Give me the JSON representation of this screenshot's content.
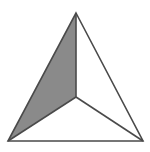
{
  "figure": {
    "name": "shaded-tetrahedron-net",
    "canvas": {
      "width": 150,
      "height": 152,
      "background_color": "#ffffff"
    },
    "style": {
      "stroke_color": "#4a4a4a",
      "stroke_width": 1.6,
      "shaded_fill_color": "#8a8a8a",
      "unshaded_fill_color": "#ffffff"
    },
    "vertices": {
      "apex": {
        "label": "apex",
        "x": 76,
        "y": 13
      },
      "bottom_left": {
        "label": "bottom-left",
        "x": 8,
        "y": 141
      },
      "bottom_right": {
        "label": "bottom-right",
        "x": 143,
        "y": 141
      },
      "center": {
        "label": "center",
        "x": 76,
        "y": 97
      }
    },
    "faces": [
      {
        "name": "left-face",
        "shaded": true,
        "fill": "#8a8a8a",
        "points": "76,13 76,97 8,141"
      },
      {
        "name": "right-face",
        "shaded": false,
        "fill": "#ffffff",
        "points": "76,13 143,141 76,97"
      },
      {
        "name": "bottom-face",
        "shaded": false,
        "fill": "#ffffff",
        "points": "8,141 76,97 143,141"
      }
    ],
    "outline": {
      "name": "outer-triangle",
      "points": "76,13 143,141 8,141"
    },
    "internal_segments": [
      {
        "name": "segment-apex-to-center",
        "x1": 76,
        "y1": 13,
        "x2": 76,
        "y2": 97
      },
      {
        "name": "segment-center-to-bottom-left",
        "x1": 76,
        "y1": 97,
        "x2": 8,
        "y2": 141
      },
      {
        "name": "segment-center-to-bottom-right",
        "x1": 76,
        "y1": 97,
        "x2": 143,
        "y2": 141
      }
    ]
  }
}
